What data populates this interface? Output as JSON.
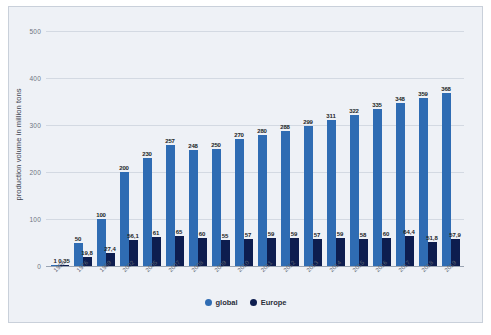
{
  "chart_data": {
    "type": "bar",
    "title": "",
    "subtitle": "",
    "xlabel": "",
    "ylabel": "production volume in million tons",
    "ylim": [
      0,
      520
    ],
    "yticks": [
      0,
      100,
      200,
      300,
      400,
      500
    ],
    "ytick_labels": [
      "0",
      "100",
      "200",
      "300",
      "400",
      "500"
    ],
    "grid": true,
    "legend_position": "bottom-center",
    "categories": [
      "1950",
      "1976",
      "1989",
      "2002",
      "2005",
      "2007",
      "2008",
      "2009",
      "2010",
      "2011",
      "2012",
      "2013",
      "2014",
      "2015",
      "2016",
      "2017",
      "2018",
      "2019"
    ],
    "series": [
      {
        "name": "global",
        "color": "#2f6cb3",
        "values": [
          1,
          50,
          100,
          200,
          230,
          257,
          248,
          250,
          270,
          280,
          288,
          299,
          311,
          322,
          335,
          348,
          359,
          368
        ],
        "labels": [
          "1",
          "50",
          "100",
          "200",
          "230",
          "257",
          "248",
          "250",
          "270",
          "280",
          "288",
          "299",
          "311",
          "322",
          "335",
          "348",
          "359",
          "368"
        ]
      },
      {
        "name": "Europe",
        "color": "#0d1d4f",
        "values": [
          0.35,
          19.8,
          27.4,
          56.1,
          61,
          65,
          60,
          55,
          57,
          59,
          59,
          57,
          59,
          58,
          60,
          64.4,
          51.8,
          57.9
        ],
        "labels": [
          "0,35",
          "19,8",
          "27,4",
          "56,1",
          "61",
          "65",
          "60",
          "55",
          "57",
          "59",
          "59",
          "57",
          "59",
          "58",
          "60",
          "64,4",
          "51,8",
          "57,9"
        ]
      }
    ]
  },
  "legend": {
    "items": [
      {
        "label": "global",
        "color": "#2f6cb3"
      },
      {
        "label": "Europe",
        "color": "#0d1d4f"
      }
    ]
  },
  "colors": {
    "global_bar": "#2f6cb3",
    "europe_bar": "#0d1d4f",
    "panel_background": "#eef1f6",
    "gridline": "#d3d9e2",
    "axis_text": "#6d7482"
  }
}
